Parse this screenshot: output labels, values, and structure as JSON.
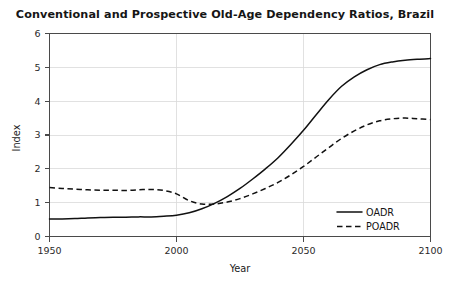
{
  "chart_data": {
    "type": "line",
    "title": "Conventional and Prospective Old-Age Dependency Ratios, Brazil",
    "xlabel": "Year",
    "ylabel": "Index",
    "xlim": [
      1950,
      2100
    ],
    "ylim": [
      0,
      6
    ],
    "xticks": [
      1950,
      2000,
      2050,
      2100
    ],
    "xtick_labels": [
      "1950",
      "2000",
      "2050",
      "2100"
    ],
    "yticks": [
      0,
      1,
      2,
      3,
      4,
      5,
      6
    ],
    "ytick_labels": [
      "0",
      "1",
      "2",
      "3",
      "4",
      "5",
      "6"
    ],
    "grid": true,
    "grid_axis": "both",
    "legend_position": "lower right",
    "x": [
      1950,
      1955,
      1960,
      1965,
      1970,
      1975,
      1980,
      1985,
      1990,
      1995,
      2000,
      2005,
      2010,
      2015,
      2020,
      2025,
      2030,
      2035,
      2040,
      2045,
      2050,
      2055,
      2060,
      2065,
      2070,
      2075,
      2080,
      2085,
      2090,
      2095,
      2100
    ],
    "series": [
      {
        "name": "OADR",
        "style": "solid",
        "color": "#111111",
        "values": [
          0.52,
          0.52,
          0.53,
          0.55,
          0.56,
          0.57,
          0.57,
          0.58,
          0.58,
          0.6,
          0.63,
          0.7,
          0.82,
          0.98,
          1.18,
          1.42,
          1.7,
          2.0,
          2.33,
          2.72,
          3.14,
          3.6,
          4.05,
          4.44,
          4.72,
          4.93,
          5.08,
          5.16,
          5.21,
          5.24,
          5.26
        ]
      },
      {
        "name": "POADR",
        "style": "dashed",
        "color": "#111111",
        "values": [
          1.45,
          1.42,
          1.4,
          1.38,
          1.37,
          1.37,
          1.36,
          1.38,
          1.39,
          1.36,
          1.26,
          1.06,
          0.96,
          0.96,
          1.02,
          1.12,
          1.26,
          1.42,
          1.6,
          1.82,
          2.07,
          2.35,
          2.63,
          2.9,
          3.12,
          3.3,
          3.42,
          3.48,
          3.5,
          3.48,
          3.46
        ]
      }
    ],
    "legend": [
      {
        "label": "OADR",
        "style": "solid"
      },
      {
        "label": "POADR",
        "style": "dashed"
      }
    ]
  },
  "axis": {
    "y_title": "Index",
    "x_title": "Year"
  }
}
